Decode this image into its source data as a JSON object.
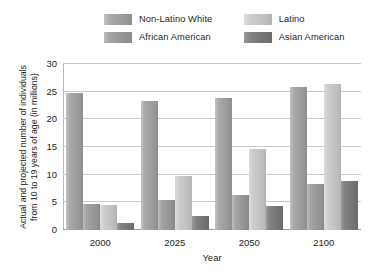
{
  "chart_data": {
    "type": "bar",
    "title": "",
    "xlabel": "Year",
    "ylabel": "Actual and projected number of individuals from 10 to 19 years of age (in millions)",
    "categories": [
      "2000",
      "2025",
      "2050",
      "2100"
    ],
    "ylim": [
      0,
      30
    ],
    "yticks": [
      0,
      5,
      10,
      15,
      20,
      25,
      30
    ],
    "ytick_labels": [
      "0",
      "5",
      "10",
      "15",
      "20",
      "25",
      "30"
    ],
    "grid": true,
    "legend_position": "top",
    "series": [
      {
        "name": "Non-Latino White",
        "color": "#9a9a9a",
        "values": [
          24.8,
          23.3,
          23.8,
          25.8
        ]
      },
      {
        "name": "African American",
        "color": "#949494",
        "values": [
          4.7,
          5.4,
          6.3,
          8.3
        ]
      },
      {
        "name": "Latino",
        "color": "#c6c6c6",
        "values": [
          4.5,
          9.8,
          14.6,
          26.3
        ]
      },
      {
        "name": "Asian American",
        "color": "#757575",
        "values": [
          1.3,
          2.5,
          4.3,
          8.8
        ]
      }
    ]
  },
  "legend": {
    "entries": [
      {
        "label": "Non-Latino White",
        "swatch": "legend-swatch-non-latino-white"
      },
      {
        "label": "Latino",
        "swatch": "legend-swatch-latino"
      },
      {
        "label": "African American",
        "swatch": "legend-swatch-african-american"
      },
      {
        "label": "Asian American",
        "swatch": "legend-swatch-asian-american"
      }
    ]
  },
  "axes": {
    "y_title": "Actual and projected number of individuals from 10 to 19 years of age (in millions)",
    "x_title": "Year"
  }
}
